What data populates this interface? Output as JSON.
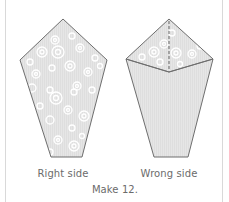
{
  "figure": {
    "panels": [
      {
        "label": "Right side",
        "shape": "pentagon",
        "fabric": "patterned-right-side"
      },
      {
        "label": "Wrong side",
        "shape": "pentagon-with-folded-top",
        "fabric": "plain-wrong-side-with-patterned-fold"
      }
    ],
    "instruction": "Make 12."
  },
  "colors": {
    "outline": "#6e6e6e",
    "fabric_fill": "#e4e4e4",
    "circle_stroke": "#ffffff",
    "frame": "#d9d9d9",
    "text": "#6b6b6b"
  }
}
